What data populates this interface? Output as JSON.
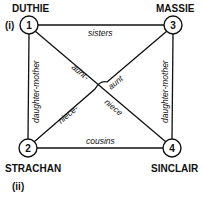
{
  "diagram": {
    "nodes": [
      {
        "id": "1",
        "label": "DUTHIE"
      },
      {
        "id": "2",
        "label": "STRACHAN"
      },
      {
        "id": "3",
        "label": "MASSIE"
      },
      {
        "id": "4",
        "label": "SINCLAIR"
      }
    ],
    "group_labels": {
      "top_left": "(i)",
      "bottom_left": "(ii)"
    },
    "edges": [
      {
        "from": "1",
        "to": "3",
        "label": "sisters"
      },
      {
        "from": "2",
        "to": "4",
        "label": "cousins"
      },
      {
        "from": "1",
        "to": "2",
        "label": "daughter-mother"
      },
      {
        "from": "3",
        "to": "4",
        "label": "daughter-mother"
      },
      {
        "from": "1",
        "to": "4",
        "label_a": "aunt-",
        "label_b": "niece"
      },
      {
        "from": "3",
        "to": "2",
        "label_a": "aunt",
        "label_b": "niece-"
      }
    ],
    "colors": {
      "ink": "#111111",
      "background": "#ffffff"
    }
  }
}
